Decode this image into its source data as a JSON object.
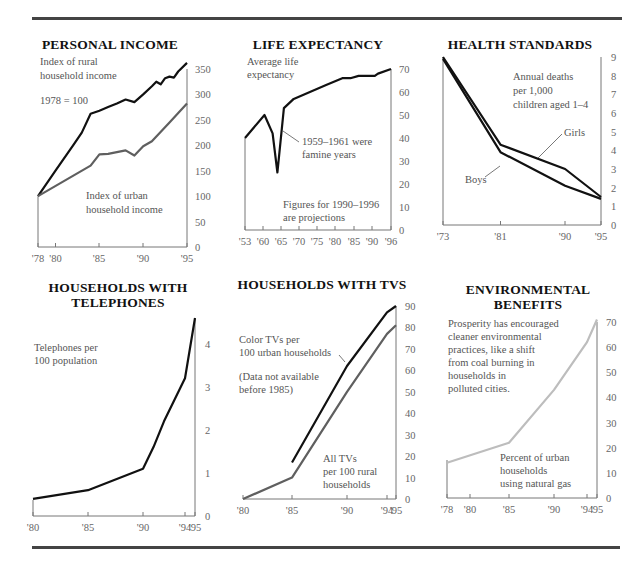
{
  "colors": {
    "black_line": "#111111",
    "gray_line": "#5f5f5f",
    "light_line": "#bdbdbd",
    "axis": "#777777",
    "rule": "#444444"
  },
  "chart_data": [
    {
      "id": "personal-income",
      "type": "line",
      "title": "PERSONAL INCOME",
      "annotations": [
        "Index of rural",
        "household income",
        "1978 = 100",
        "Index of urban",
        "household income"
      ],
      "x_ticks": [
        "'78",
        "'80",
        "'85",
        "'90",
        "'95"
      ],
      "y_ticks": [
        0,
        50,
        100,
        150,
        200,
        250,
        300,
        350
      ],
      "ylim": [
        0,
        350
      ],
      "x": [
        1978,
        1985,
        1986,
        1988,
        1989,
        1990,
        1991,
        1992,
        1993,
        1994,
        1995
      ],
      "series": [
        {
          "name": "Index of rural household income",
          "color": "black",
          "points": [
            [
              1978,
              100
            ],
            [
              1980,
              150
            ],
            [
              1982,
              200
            ],
            [
              1983,
              225
            ],
            [
              1984,
              262
            ],
            [
              1985,
              268
            ],
            [
              1986,
              275
            ],
            [
              1987,
              282
            ],
            [
              1988,
              290
            ],
            [
              1989,
              285
            ],
            [
              1990,
              300
            ],
            [
              1991,
              316
            ],
            [
              1991.5,
              325
            ],
            [
              1992,
              320
            ],
            [
              1992.5,
              332
            ],
            [
              1993,
              335
            ],
            [
              1993.5,
              333
            ],
            [
              1994,
              345
            ],
            [
              1995,
              362
            ]
          ]
        },
        {
          "name": "Index of urban household income",
          "color": "gray",
          "points": [
            [
              1978,
              100
            ],
            [
              1984,
              160
            ],
            [
              1985,
              182
            ],
            [
              1986,
              183
            ],
            [
              1988,
              190
            ],
            [
              1989,
              180
            ],
            [
              1990,
              198
            ],
            [
              1991,
              208
            ],
            [
              1993,
              245
            ],
            [
              1995,
              282
            ]
          ]
        }
      ]
    },
    {
      "id": "life-expectancy",
      "type": "line",
      "title": "LIFE EXPECTANCY",
      "annotations": [
        "Average life",
        "expectancy",
        "1959–1961 were",
        "famine years",
        "Figures for 1990–1996",
        "are projections"
      ],
      "x_ticks": [
        "'53",
        "'60",
        "'65",
        "'70",
        "'75",
        "'80",
        "'85",
        "'90",
        "'96"
      ],
      "y_ticks": [
        0,
        10,
        20,
        30,
        40,
        50,
        60,
        70
      ],
      "ylim": [
        0,
        70
      ],
      "series": [
        {
          "name": "Average life expectancy",
          "color": "black",
          "points": [
            [
              0,
              40
            ],
            [
              1.2,
              50
            ],
            [
              1.7,
              42
            ],
            [
              2.0,
              25
            ],
            [
              2.4,
              53
            ],
            [
              3.0,
              57
            ],
            [
              4.0,
              60
            ],
            [
              5.0,
              63
            ],
            [
              6.0,
              66
            ],
            [
              6.5,
              66
            ],
            [
              7.0,
              67
            ],
            [
              7.5,
              67
            ],
            [
              8.0,
              67
            ],
            [
              8.2,
              68
            ],
            [
              9.0,
              70
            ]
          ]
        }
      ]
    },
    {
      "id": "health-standards",
      "type": "line",
      "title": "HEALTH STANDARDS",
      "annotations": [
        "Annual deaths",
        "per 1,000",
        "children aged 1–4",
        "Girls",
        "Boys"
      ],
      "x_ticks": [
        "'73",
        "'81",
        "'90",
        "'95"
      ],
      "y_ticks": [
        0,
        1,
        2,
        3,
        4,
        5,
        6,
        7,
        8,
        9
      ],
      "ylim": [
        0,
        9
      ],
      "series": [
        {
          "name": "Girls",
          "color": "black",
          "points": [
            [
              1973,
              9.0
            ],
            [
              1981,
              4.3
            ],
            [
              1990,
              3.0
            ],
            [
              1995,
              1.5
            ]
          ]
        },
        {
          "name": "Boys",
          "color": "black",
          "points": [
            [
              1973,
              8.9
            ],
            [
              1981,
              3.9
            ],
            [
              1990,
              2.1
            ],
            [
              1995,
              1.4
            ]
          ]
        }
      ]
    },
    {
      "id": "households-with-telephones",
      "type": "line",
      "title": "HOUSEHOLDS WITH TELEPHONES",
      "annotations": [
        "Telephones per",
        "100 population"
      ],
      "x_ticks": [
        "'80",
        "'85",
        "'90",
        "'94",
        "'95"
      ],
      "y_ticks": [
        0,
        1,
        2,
        3,
        4
      ],
      "ylim": [
        0,
        4.6
      ],
      "series": [
        {
          "name": "Telephones per 100 population",
          "color": "black",
          "points": [
            [
              1980,
              0.4
            ],
            [
              1985,
              0.6
            ],
            [
              1990,
              1.1
            ],
            [
              1991,
              1.6
            ],
            [
              1992,
              2.2
            ],
            [
              1993,
              2.7
            ],
            [
              1994,
              3.2
            ],
            [
              1995,
              4.6
            ]
          ]
        }
      ]
    },
    {
      "id": "households-with-tvs",
      "type": "line",
      "title": "HOUSEHOLDS WITH TVS",
      "annotations": [
        "Color TVs per",
        "100 urban households",
        "(Data not available",
        "before 1985)",
        "All TVs",
        "per 100 rural",
        "households"
      ],
      "x_ticks": [
        "'80",
        "'85",
        "'90",
        "'94",
        "'95"
      ],
      "y_ticks": [
        0,
        10,
        20,
        30,
        40,
        50,
        60,
        70,
        80,
        90
      ],
      "ylim": [
        0,
        90
      ],
      "series": [
        {
          "name": "Color TVs per 100 urban households",
          "color": "black",
          "points": [
            [
              1985,
              17
            ],
            [
              1990,
              62
            ],
            [
              1994,
              87
            ],
            [
              1995,
              90
            ]
          ]
        },
        {
          "name": "All TVs per 100 rural households",
          "color": "gray",
          "points": [
            [
              1980,
              0
            ],
            [
              1985,
              10
            ],
            [
              1990,
              50
            ],
            [
              1994,
              77
            ],
            [
              1995,
              81
            ]
          ]
        }
      ]
    },
    {
      "id": "environmental-benefits",
      "type": "line",
      "title": "ENVIRONMENTAL BENEFITS",
      "annotations": [
        "Prosperity has encouraged",
        "cleaner environmental",
        "practices, like a shift",
        "from coal burning in",
        "households in",
        "polluted cities.",
        "Percent of urban",
        "households",
        "using natural gas"
      ],
      "x_ticks": [
        "'78",
        "'80",
        "'85",
        "'90",
        "'94",
        "'95"
      ],
      "y_ticks": [
        0,
        10,
        20,
        30,
        40,
        50,
        60,
        70
      ],
      "ylim": [
        0,
        70
      ],
      "series": [
        {
          "name": "Percent of urban households using natural gas",
          "color": "light-gray",
          "points": [
            [
              1978,
              14
            ],
            [
              1985,
              22
            ],
            [
              1990,
              43
            ],
            [
              1994,
              62
            ],
            [
              1995,
              71
            ]
          ]
        }
      ]
    }
  ]
}
